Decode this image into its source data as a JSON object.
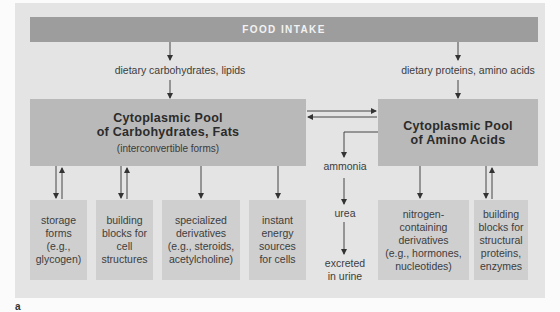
{
  "diagram": {
    "food_intake": "FOOD INTAKE",
    "dietary_left": "dietary carbohydrates, lipids",
    "dietary_right": "dietary proteins, amino acids",
    "pool_left": {
      "line1": "Cytoplasmic Pool",
      "line2": "of Carbohydrates, Fats",
      "sub": "(interconvertible forms)"
    },
    "pool_right": {
      "line1": "Cytoplasmic Pool",
      "line2": "of Amino Acids"
    },
    "middle": {
      "ammonia": "ammonia",
      "urea": "urea",
      "excreted_1": "excreted",
      "excreted_2": "in urine"
    },
    "leaves": [
      {
        "lines": [
          "storage",
          "forms",
          "(e.g.,",
          "glycogen)"
        ],
        "arrow": "bidirectional"
      },
      {
        "lines": [
          "building",
          "blocks for",
          "cell",
          "structures"
        ],
        "arrow": "bidirectional"
      },
      {
        "lines": [
          "specialized",
          "derivatives",
          "(e.g., steroids,",
          "acetylcholine)"
        ],
        "arrow": "down"
      },
      {
        "lines": [
          "instant",
          "energy",
          "sources",
          "for cells"
        ],
        "arrow": "down"
      },
      {
        "lines": [
          "nitrogen-",
          "containing",
          "derivatives",
          "(e.g., hormones,",
          "nucleotides)"
        ],
        "arrow": "down"
      },
      {
        "lines": [
          "building",
          "blocks for",
          "structural",
          "proteins,",
          "enzymes"
        ],
        "arrow": "bidirectional"
      }
    ],
    "figure_label": "a",
    "colors": {
      "panel": "#e4e4e4",
      "food_bar": "#9d9d9d",
      "pool": "#b9b9b9",
      "leaf": "#cfcfcf",
      "arrow": "#333333"
    }
  }
}
